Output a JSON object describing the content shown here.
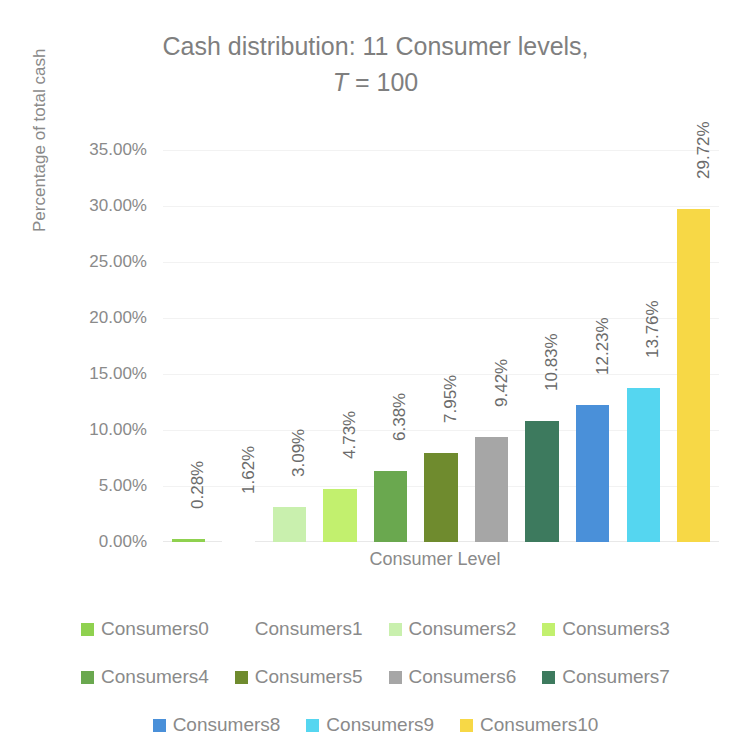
{
  "chart_data": {
    "type": "bar",
    "title": "Cash distribution: 11 Consumer levels,",
    "title_line2_prefix": "T",
    "title_line2_rest": " = 100",
    "xlabel": "Consumer Level",
    "ylabel": "Percentage of total cash",
    "categories": [
      "Consumers0",
      "Consumers1",
      "Consumers2",
      "Consumers3",
      "Consumers4",
      "Consumers5",
      "Consumers6",
      "Consumers7",
      "Consumers8",
      "Consumers9",
      "Consumers10"
    ],
    "values": [
      0.28,
      1.62,
      3.09,
      4.73,
      6.38,
      7.95,
      9.42,
      10.83,
      12.23,
      13.76,
      29.72
    ],
    "data_labels": [
      "0.28%",
      "1.62%",
      "3.09%",
      "4.73%",
      "6.38%",
      "7.95%",
      "9.42%",
      "10.83%",
      "12.23%",
      "13.76%",
      "29.72%"
    ],
    "colors": [
      "#8fd14f",
      "#ffffff",
      "#c9f0ae",
      "#c2f06e",
      "#6aa84f",
      "#6f8b2e",
      "#a6a6a6",
      "#3d7a5e",
      "#4a90d9",
      "#55d6f0",
      "#f7d846"
    ],
    "ylim": [
      0,
      35
    ],
    "yticks": [
      0,
      5,
      10,
      15,
      20,
      25,
      30,
      35
    ],
    "ytick_labels": [
      "0.00%",
      "5.00%",
      "10.00%",
      "15.00%",
      "20.00%",
      "25.00%",
      "30.00%",
      "35.00%"
    ],
    "grid": true,
    "legend_position": "bottom",
    "legend_rows": [
      [
        "Consumers0",
        "Consumers1",
        "Consumers2",
        "Consumers3"
      ],
      [
        "Consumers4",
        "Consumers5",
        "Consumers6",
        "Consumers7"
      ],
      [
        "Consumers8",
        "Consumers9",
        "Consumers10"
      ]
    ]
  }
}
